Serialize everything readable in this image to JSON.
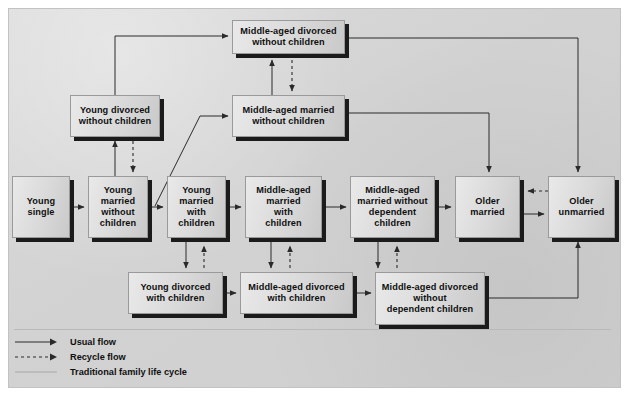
{
  "diagram": {
    "nodes": [
      {
        "id": "mid_div_wo_child",
        "label": "Middle-aged divorced\nwithout children",
        "x": 232,
        "y": 20,
        "w": 113,
        "h": 34
      },
      {
        "id": "young_div_wo_child",
        "label": "Young divorced\nwithout children",
        "x": 70,
        "y": 95,
        "w": 90,
        "h": 42
      },
      {
        "id": "mid_mar_wo_child",
        "label": "Middle-aged married\nwithout children",
        "x": 232,
        "y": 95,
        "w": 113,
        "h": 42
      },
      {
        "id": "young_single",
        "label": "Young\nsingle",
        "x": 12,
        "y": 176,
        "w": 58,
        "h": 62
      },
      {
        "id": "young_mar_wo_child",
        "label": "Young\nmarried\nwithout\nchildren",
        "x": 88,
        "y": 176,
        "w": 60,
        "h": 62
      },
      {
        "id": "young_mar_child",
        "label": "Young\nmarried\nwith\nchildren",
        "x": 167,
        "y": 176,
        "w": 59,
        "h": 62
      },
      {
        "id": "mid_mar_child",
        "label": "Middle-aged\nmarried\nwith\nchildren",
        "x": 245,
        "y": 176,
        "w": 77,
        "h": 62
      },
      {
        "id": "mid_mar_wo_dep",
        "label": "Middle-aged\nmarried without\ndependent\nchildren",
        "x": 350,
        "y": 176,
        "w": 85,
        "h": 62
      },
      {
        "id": "older_married",
        "label": "Older\nmarried",
        "x": 455,
        "y": 176,
        "w": 65,
        "h": 62
      },
      {
        "id": "older_unmarried",
        "label": "Older\nunmarried",
        "x": 548,
        "y": 176,
        "w": 67,
        "h": 62
      },
      {
        "id": "young_div_child",
        "label": "Young divorced\nwith children",
        "x": 128,
        "y": 272,
        "w": 95,
        "h": 42
      },
      {
        "id": "mid_div_child",
        "label": "Middle-aged divorced\nwith children",
        "x": 240,
        "y": 272,
        "w": 113,
        "h": 42
      },
      {
        "id": "mid_div_wo_dep",
        "label": "Middle-aged divorced\nwithout\ndependent children",
        "x": 375,
        "y": 272,
        "w": 110,
        "h": 53
      }
    ],
    "edges": [
      {
        "from": "young_single",
        "to": "young_mar_wo_child",
        "type": "usual"
      },
      {
        "from": "young_mar_wo_child",
        "to": "young_mar_child",
        "type": "usual"
      },
      {
        "from": "young_mar_child",
        "to": "mid_mar_child",
        "type": "usual"
      },
      {
        "from": "mid_mar_child",
        "to": "mid_mar_wo_dep",
        "type": "usual"
      },
      {
        "from": "mid_mar_wo_dep",
        "to": "older_married",
        "type": "usual"
      },
      {
        "from": "older_married",
        "to": "older_unmarried",
        "type": "usual"
      },
      {
        "from": "older_unmarried",
        "to": "older_married",
        "type": "recycle"
      },
      {
        "from": "young_mar_wo_child",
        "to": "young_div_wo_child",
        "type": "usual"
      },
      {
        "from": "young_div_wo_child",
        "to": "young_mar_wo_child",
        "type": "recycle"
      },
      {
        "from": "young_div_wo_child",
        "to": "mid_div_wo_child",
        "type": "usual"
      },
      {
        "from": "young_mar_wo_child",
        "to": "mid_mar_wo_child",
        "type": "usual"
      },
      {
        "from": "mid_mar_wo_child",
        "to": "mid_div_wo_child",
        "type": "usual"
      },
      {
        "from": "mid_div_wo_child",
        "to": "mid_mar_wo_child",
        "type": "recycle"
      },
      {
        "from": "mid_div_wo_child",
        "to": "older_unmarried",
        "type": "usual"
      },
      {
        "from": "mid_mar_wo_child",
        "to": "older_married",
        "type": "usual"
      },
      {
        "from": "young_mar_child",
        "to": "young_div_child",
        "type": "usual"
      },
      {
        "from": "young_div_child",
        "to": "young_mar_child",
        "type": "recycle"
      },
      {
        "from": "mid_mar_child",
        "to": "mid_div_child",
        "type": "usual"
      },
      {
        "from": "mid_div_child",
        "to": "mid_mar_child",
        "type": "recycle"
      },
      {
        "from": "mid_mar_wo_dep",
        "to": "mid_div_wo_dep",
        "type": "usual"
      },
      {
        "from": "mid_div_wo_dep",
        "to": "mid_mar_wo_dep",
        "type": "recycle"
      },
      {
        "from": "young_div_child",
        "to": "mid_div_child",
        "type": "usual"
      },
      {
        "from": "mid_div_child",
        "to": "mid_div_wo_dep",
        "type": "usual"
      },
      {
        "from": "mid_div_wo_dep",
        "to": "older_unmarried",
        "type": "usual"
      }
    ],
    "legend": [
      {
        "id": "usual",
        "label": "Usual flow",
        "style": "solid-arrow"
      },
      {
        "id": "recycle",
        "label": "Recycle flow",
        "style": "dashed-arrow"
      },
      {
        "id": "traditional",
        "label": "Traditional family life cycle",
        "style": "faint-line"
      }
    ],
    "colors": {
      "background": "#d4d4d4",
      "node_fill": "#dcdcdc",
      "node_shadow": "#1b1b1b",
      "line": "#2a2a2a",
      "faint_line": "#bcbcbc"
    }
  }
}
